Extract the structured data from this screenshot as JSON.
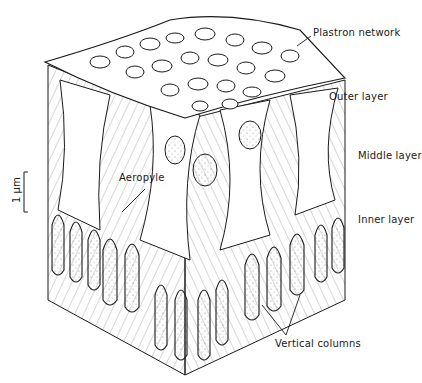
{
  "diagram": {
    "labels": {
      "plastron_network": "Plastron network",
      "outer_layer": "Outer layer",
      "middle_layer": "Middle layer",
      "aeropyle": "Aeropyle",
      "inner_layer": "Inner layer",
      "vertical_columns": "Vertical columns"
    },
    "scale_bar": {
      "label": "1 μm"
    },
    "colors": {
      "ink": "#1a1a1a",
      "background": "#ffffff",
      "stipple": "#8a8a8a"
    }
  }
}
